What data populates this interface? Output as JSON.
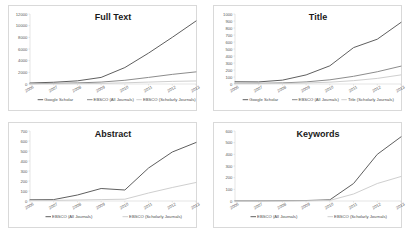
{
  "figure": {
    "background": "#ffffff",
    "panel_border": "#d9d9d9"
  },
  "colors": {
    "google_scholar": "#5f5f5f",
    "ebsco_all": "#8c8c8c",
    "ebsco_scholarly": "#cfcfcf",
    "axis": "#c8c8c8",
    "text": "#5a5a5a",
    "title": "#1a1a1a"
  },
  "chart_data": [
    {
      "type": "line",
      "title": "Full Text",
      "xlabel": "",
      "ylabel": "",
      "x": [
        "2006",
        "2007",
        "2008",
        "2009",
        "2010",
        "2011",
        "2012",
        "2013"
      ],
      "ylim": [
        0,
        12000
      ],
      "yticks": [
        0,
        2000,
        4000,
        6000,
        8000,
        10000,
        12000
      ],
      "ytick_labels": [
        "0",
        "2000",
        "4000",
        "6000",
        "8000",
        "10000",
        "12000"
      ],
      "grid": false,
      "legend_position": "bottom",
      "series": [
        {
          "name": "Google Scholar",
          "color": "#5f5f5f",
          "values": [
            170,
            300,
            540,
            1130,
            2820,
            5300,
            8000,
            10800
          ]
        },
        {
          "name": "EBSCO (All Journals)",
          "color": "#8c8c8c",
          "values": [
            60,
            110,
            190,
            330,
            640,
            1130,
            1650,
            2080
          ]
        },
        {
          "name": "EBSCO (Scholarly Journals)",
          "color": "#cfcfcf",
          "values": [
            20,
            35,
            60,
            110,
            200,
            330,
            450,
            520
          ]
        }
      ]
    },
    {
      "type": "line",
      "title": "Title",
      "xlabel": "",
      "ylabel": "",
      "x": [
        "2006",
        "2007",
        "2008",
        "2009",
        "2010",
        "2011",
        "2012",
        "2013"
      ],
      "ylim": [
        0,
        1000
      ],
      "yticks": [
        0,
        100,
        200,
        300,
        400,
        500,
        600,
        700,
        800,
        900,
        1000
      ],
      "ytick_labels": [
        "0",
        "100",
        "200",
        "300",
        "400",
        "500",
        "600",
        "700",
        "800",
        "900",
        "1000"
      ],
      "grid": false,
      "legend_position": "bottom",
      "series": [
        {
          "name": "Google Scholar",
          "color": "#5f5f5f",
          "values": [
            32,
            30,
            55,
            130,
            260,
            520,
            640,
            880
          ]
        },
        {
          "name": "EBSCO (All Journals)",
          "color": "#8c8c8c",
          "values": [
            10,
            10,
            16,
            30,
            60,
            110,
            175,
            255
          ]
        },
        {
          "name": "Title (Scholarly Journals)",
          "color": "#cfcfcf",
          "values": [
            5,
            5,
            8,
            14,
            26,
            48,
            80,
            130
          ]
        }
      ]
    },
    {
      "type": "line",
      "title": "Abstract",
      "xlabel": "",
      "ylabel": "",
      "x": [
        "2006",
        "2007",
        "2008",
        "2009",
        "2010",
        "2011",
        "2012",
        "2013"
      ],
      "ylim": [
        0,
        700
      ],
      "yticks": [
        0,
        100,
        200,
        300,
        400,
        500,
        600,
        700
      ],
      "ytick_labels": [
        "0",
        "100",
        "200",
        "300",
        "400",
        "500",
        "600",
        "700"
      ],
      "grid": false,
      "legend_position": "bottom",
      "series": [
        {
          "name": "EBSCO (All Journals)",
          "color": "#5f5f5f",
          "values": [
            12,
            14,
            60,
            125,
            110,
            330,
            490,
            585
          ]
        },
        {
          "name": "EBSCO (Scholarly Journals)",
          "color": "#cfcfcf",
          "values": [
            5,
            6,
            10,
            14,
            18,
            80,
            135,
            185
          ]
        }
      ]
    },
    {
      "type": "line",
      "title": "Keywords",
      "xlabel": "",
      "ylabel": "",
      "x": [
        "2006",
        "2007",
        "2008",
        "2009",
        "2010",
        "2011",
        "2012",
        "2013"
      ],
      "ylim": [
        0,
        600
      ],
      "yticks": [
        0,
        100,
        200,
        300,
        400,
        500,
        600
      ],
      "ytick_labels": [
        "0",
        "100",
        "200",
        "300",
        "400",
        "500",
        "600"
      ],
      "grid": false,
      "legend_position": "bottom",
      "series": [
        {
          "name": "EBSCO (All Journals)",
          "color": "#5f5f5f",
          "values": [
            2,
            2,
            3,
            4,
            10,
            150,
            400,
            550
          ]
        },
        {
          "name": "EBSCO (Scholarly Journals)",
          "color": "#cfcfcf",
          "values": [
            1,
            1,
            1,
            2,
            5,
            60,
            150,
            210
          ]
        }
      ]
    }
  ]
}
